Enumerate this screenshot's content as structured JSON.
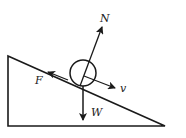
{
  "diagram": {
    "labels": {
      "normal": "N",
      "friction": "F",
      "velocity": "v",
      "weight": "W"
    },
    "colors": {
      "stroke": "#1a1a1a",
      "background": "#ffffff"
    }
  }
}
